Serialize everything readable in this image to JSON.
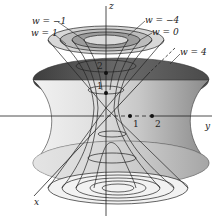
{
  "figure": {
    "axes": {
      "x_label": "x",
      "y_label": "y",
      "z_label": "z"
    },
    "z_ticks": [
      "1",
      "2"
    ],
    "y_ticks": [
      "1",
      "2"
    ],
    "level_labels": [
      {
        "id": "w-neg1",
        "text": "w = −1"
      },
      {
        "id": "w-1",
        "text": "w = 1"
      },
      {
        "id": "w-neg4",
        "text": "w = −4"
      },
      {
        "id": "w-0",
        "text": "w = 0"
      },
      {
        "id": "w-4",
        "text": "w = 4"
      }
    ],
    "colors": {
      "outer_surface_dark": "#5a5a5a",
      "outer_surface_mid": "#9a9a9a",
      "outer_surface_light": "#e6e6e6",
      "line": "#222222",
      "background": "#ffffff"
    }
  }
}
